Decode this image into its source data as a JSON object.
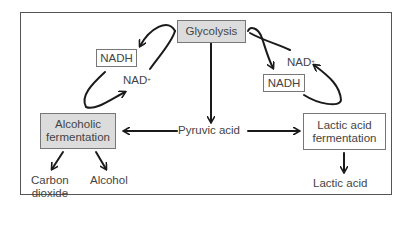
{
  "diagram": {
    "nodes": {
      "glycolysis": "Glycolysis",
      "pyruvic_acid": "Pyruvic acid",
      "alcoholic_fermentation_line1": "Alcoholic",
      "alcoholic_fermentation_line2": "fermentation",
      "lactic_fermentation_line1": "Lactic acid",
      "lactic_fermentation_line2": "fermentation",
      "nadh_left": "NADH",
      "nad_left": "NAD",
      "nadh_right": "NADH",
      "nad_right": "NAD",
      "nad_superscript": "+",
      "carbon_dioxide_line1": "Carbon",
      "carbon_dioxide_line2": "dioxide",
      "alcohol": "Alcohol",
      "lactic_acid": "Lactic acid"
    },
    "edges": [
      {
        "from": "Glycolysis",
        "to": "Pyruvic acid"
      },
      {
        "from": "Pyruvic acid",
        "to": "Alcoholic fermentation"
      },
      {
        "from": "Pyruvic acid",
        "to": "Lactic acid fermentation"
      },
      {
        "from": "Alcoholic fermentation",
        "to": "Carbon dioxide"
      },
      {
        "from": "Alcoholic fermentation",
        "to": "Alcohol"
      },
      {
        "from": "Lactic acid fermentation",
        "to": "Lactic acid"
      },
      {
        "from": "Glycolysis",
        "to": "NADH (left)",
        "cycle": "left"
      },
      {
        "from": "NAD+ (left)",
        "to": "Glycolysis",
        "cycle": "left"
      },
      {
        "from": "Glycolysis",
        "to": "NADH (right)",
        "cycle": "right"
      },
      {
        "from": "NAD+ (right)",
        "to": "Glycolysis",
        "cycle": "right"
      }
    ],
    "colors": {
      "shaded_box": "#dcdcdc",
      "border": "#777777",
      "arrow": "#1a1a1a",
      "text": "#444444"
    }
  }
}
